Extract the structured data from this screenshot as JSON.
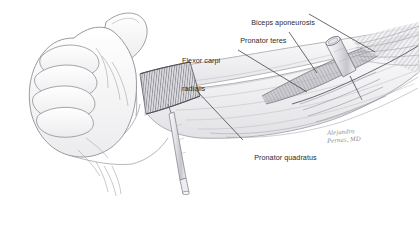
{
  "figure": {
    "background_color": "#ffffff",
    "ink_color": "#8a8a8f",
    "label_color": "#2b2b2b",
    "shade_color": "#9a9aa0"
  },
  "labels": [
    {
      "id": "biceps-aponeurosis",
      "text": "Biceps aponeurosis",
      "lines": [
        "Biceps aponeurosis"
      ],
      "x": 243,
      "y": 9
    },
    {
      "id": "pronator-teres",
      "text": "Pronator teres",
      "lines": [
        "Pronator teres"
      ],
      "x": 232,
      "y": 27
    },
    {
      "id": "flexor-carpi-radialis",
      "text": "Flexor carpi radialis",
      "lines": [
        "Flexor carpi",
        "radialis"
      ],
      "x": 182,
      "y": 38
    },
    {
      "id": "pronator-quadratus",
      "text": "Pronator quadratus",
      "lines": [
        "Pronator quadratus"
      ],
      "x": 246,
      "y": 144
    }
  ],
  "label_text": {
    "biceps_aponeurosis": "Biceps aponeurosis",
    "pronator_teres": "Pronator teres",
    "flexor_carpi_radialis_line1": "Flexor carpi",
    "flexor_carpi_radialis_line2": "radialis",
    "pronator_quadratus": "Pronator quadratus"
  },
  "signature": {
    "line1": "Alejandro",
    "line2": "Pernas, MD",
    "x": 327,
    "y": 129
  },
  "anatomy": {
    "hand": "clenched-fist-with-extended-thumb",
    "forearm": "volar-forearm-pronated",
    "muscles": [
      "pronator teres",
      "flexor carpi radialis",
      "pronator quadratus",
      "biceps aponeurosis"
    ]
  },
  "instruments": [
    {
      "id": "distal-needle",
      "name": "syringe-needle-pronator-quadratus",
      "target": "pronator quadratus"
    },
    {
      "id": "proximal-needle",
      "name": "syringe-needle-pronator-teres",
      "target": "pronator teres"
    }
  ]
}
